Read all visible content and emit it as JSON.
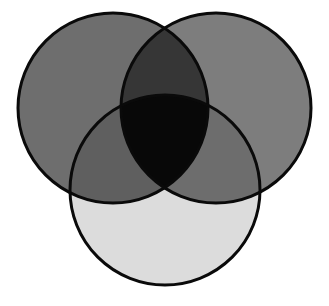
{
  "page": {
    "background_color": "#ffffff",
    "width": 329,
    "height": 306
  },
  "chart_data": {
    "type": "venn",
    "title": "",
    "subtitle": "",
    "xlabel": "",
    "ylabel": "",
    "grid": false,
    "legend_position": "none",
    "axes_visible": false,
    "set_count": 3,
    "stroke_color": "#0a0a0a",
    "stroke_width": 3,
    "blend_mode": "multiply",
    "sets": [
      {
        "id": "A",
        "label": "",
        "position": "top-left",
        "cx": 113,
        "cy": 108,
        "r": 95,
        "fill": "#6e6e6e",
        "opacity": 1
      },
      {
        "id": "B",
        "label": "",
        "position": "top-right",
        "cx": 216,
        "cy": 108,
        "r": 95,
        "fill": "#7d7d7d",
        "opacity": 1
      },
      {
        "id": "C",
        "label": "",
        "position": "bottom-center",
        "cx": 165,
        "cy": 190,
        "r": 95,
        "fill": "#dcdcdc",
        "opacity": 1
      }
    ],
    "regions": [
      {
        "id": "A-only",
        "sets": [
          "A"
        ],
        "fill": "#6e6e6e",
        "label": ""
      },
      {
        "id": "B-only",
        "sets": [
          "B"
        ],
        "fill": "#7d7d7d",
        "label": ""
      },
      {
        "id": "C-only",
        "sets": [
          "C"
        ],
        "fill": "#dcdcdc",
        "label": ""
      },
      {
        "id": "A-and-B",
        "sets": [
          "A",
          "B"
        ],
        "fill": "#363636",
        "label": ""
      },
      {
        "id": "A-and-C",
        "sets": [
          "A",
          "C"
        ],
        "fill": "#5f5f5f",
        "label": ""
      },
      {
        "id": "B-and-C",
        "sets": [
          "B",
          "C"
        ],
        "fill": "#6d6d6d",
        "label": ""
      },
      {
        "id": "A-B-and-C",
        "sets": [
          "A",
          "B",
          "C"
        ],
        "fill": "#080808",
        "label": ""
      }
    ]
  }
}
